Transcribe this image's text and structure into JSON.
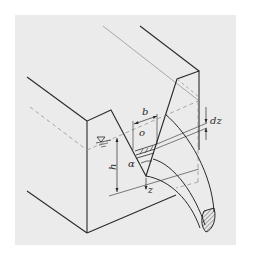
{
  "figure": {
    "labels": {
      "b": "b",
      "o": "o",
      "dz": "dz",
      "h": "h",
      "alpha": "α",
      "z": "z",
      "water_level_symbol": "▽"
    },
    "colors": {
      "background": "#ebebeb",
      "line": "#2a2a2a",
      "thin_line": "#7a7a7a"
    }
  }
}
